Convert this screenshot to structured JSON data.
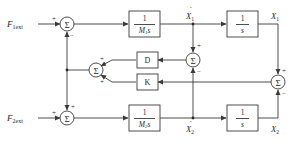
{
  "diagram": {
    "type": "block-diagram",
    "colors": {
      "line": "#3a3a3a",
      "block_border": "#3a3a3a",
      "text": "#2a2a2a",
      "background": "#ffffff"
    },
    "inputs": [
      {
        "id": "F1ext",
        "base": "F",
        "sub": "1ext"
      },
      {
        "id": "F2ext",
        "base": "F",
        "sub": "2ext"
      }
    ],
    "blocks": [
      {
        "id": "G1",
        "num": "1",
        "den_base": "M",
        "den_sub": "1",
        "den_tail": "s"
      },
      {
        "id": "I1",
        "num": "1",
        "den": "s"
      },
      {
        "id": "G2",
        "num": "1",
        "den_base": "M",
        "den_sub": "2",
        "den_tail": "s"
      },
      {
        "id": "I2",
        "num": "1",
        "den": "s"
      },
      {
        "id": "D",
        "label": "D"
      },
      {
        "id": "K",
        "label": "K"
      }
    ],
    "summing_junctions": [
      {
        "id": "sum_top",
        "symbol": "Σ",
        "signs": [
          "+",
          "−"
        ]
      },
      {
        "id": "sum_bottom",
        "symbol": "Σ",
        "signs": [
          "+",
          "+"
        ]
      },
      {
        "id": "sum_mid_left",
        "symbol": "Σ",
        "signs": [
          "+",
          "+"
        ]
      },
      {
        "id": "sum_mid_center",
        "symbol": "Σ",
        "signs": [
          "+",
          "−"
        ]
      },
      {
        "id": "sum_right",
        "symbol": "Σ",
        "signs": [
          "+",
          "−"
        ]
      }
    ],
    "signals": [
      {
        "id": "X1dot",
        "base": "X",
        "sub": "1",
        "dot": "·"
      },
      {
        "id": "X1",
        "base": "X",
        "sub": "1"
      },
      {
        "id": "X2dot",
        "base": "X",
        "sub": "2",
        "dot": "·"
      },
      {
        "id": "X2",
        "base": "X",
        "sub": "2"
      }
    ]
  }
}
